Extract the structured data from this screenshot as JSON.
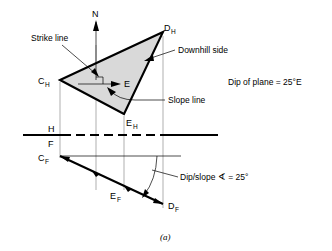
{
  "figure": {
    "caption": "(a)",
    "compass_north_label": "N",
    "east_label": "E",
    "annotations": {
      "strike_line": "Strike line",
      "downhill_side": "Downhill side",
      "slope_line": "Slope line",
      "dip_of_plane": "Dip of plane = 25°E",
      "dip_slope_angle": "Dip/slope ∢ = 25°"
    },
    "reference_line": {
      "horizontal_label": "H",
      "frontal_label": "F"
    },
    "points": [
      {
        "id": "C_H",
        "base": "C",
        "sub": "H",
        "x": 60,
        "y": 80
      },
      {
        "id": "D_H",
        "base": "D",
        "sub": "H",
        "x": 163,
        "y": 32
      },
      {
        "id": "E_H",
        "base": "E",
        "sub": "H",
        "x": 124,
        "y": 114
      },
      {
        "id": "C_F",
        "base": "C",
        "sub": "F",
        "x": 60,
        "y": 156
      },
      {
        "id": "E_F",
        "base": "E",
        "sub": "F",
        "x": 124,
        "y": 186
      },
      {
        "id": "D_F",
        "base": "D",
        "sub": "F",
        "x": 163,
        "y": 204
      }
    ],
    "labels": {
      "CH": {
        "base": "C",
        "sub": "H",
        "x": 40,
        "y": 83
      },
      "DH": {
        "base": "D",
        "sub": "H",
        "x": 166,
        "y": 30
      },
      "EH": {
        "base": "E",
        "sub": "H",
        "x": 127,
        "y": 127
      },
      "CF": {
        "base": "C",
        "sub": "F",
        "x": 40,
        "y": 162
      },
      "EF": {
        "base": "E",
        "sub": "F",
        "x": 113,
        "y": 200
      },
      "DF": {
        "base": "D",
        "sub": "F",
        "x": 172,
        "y": 210
      }
    },
    "colors": {
      "plane_fill": "#d9d9d9",
      "outline": "#000000",
      "projection_line": "#8d8d8d",
      "background": "#ffffff"
    }
  }
}
